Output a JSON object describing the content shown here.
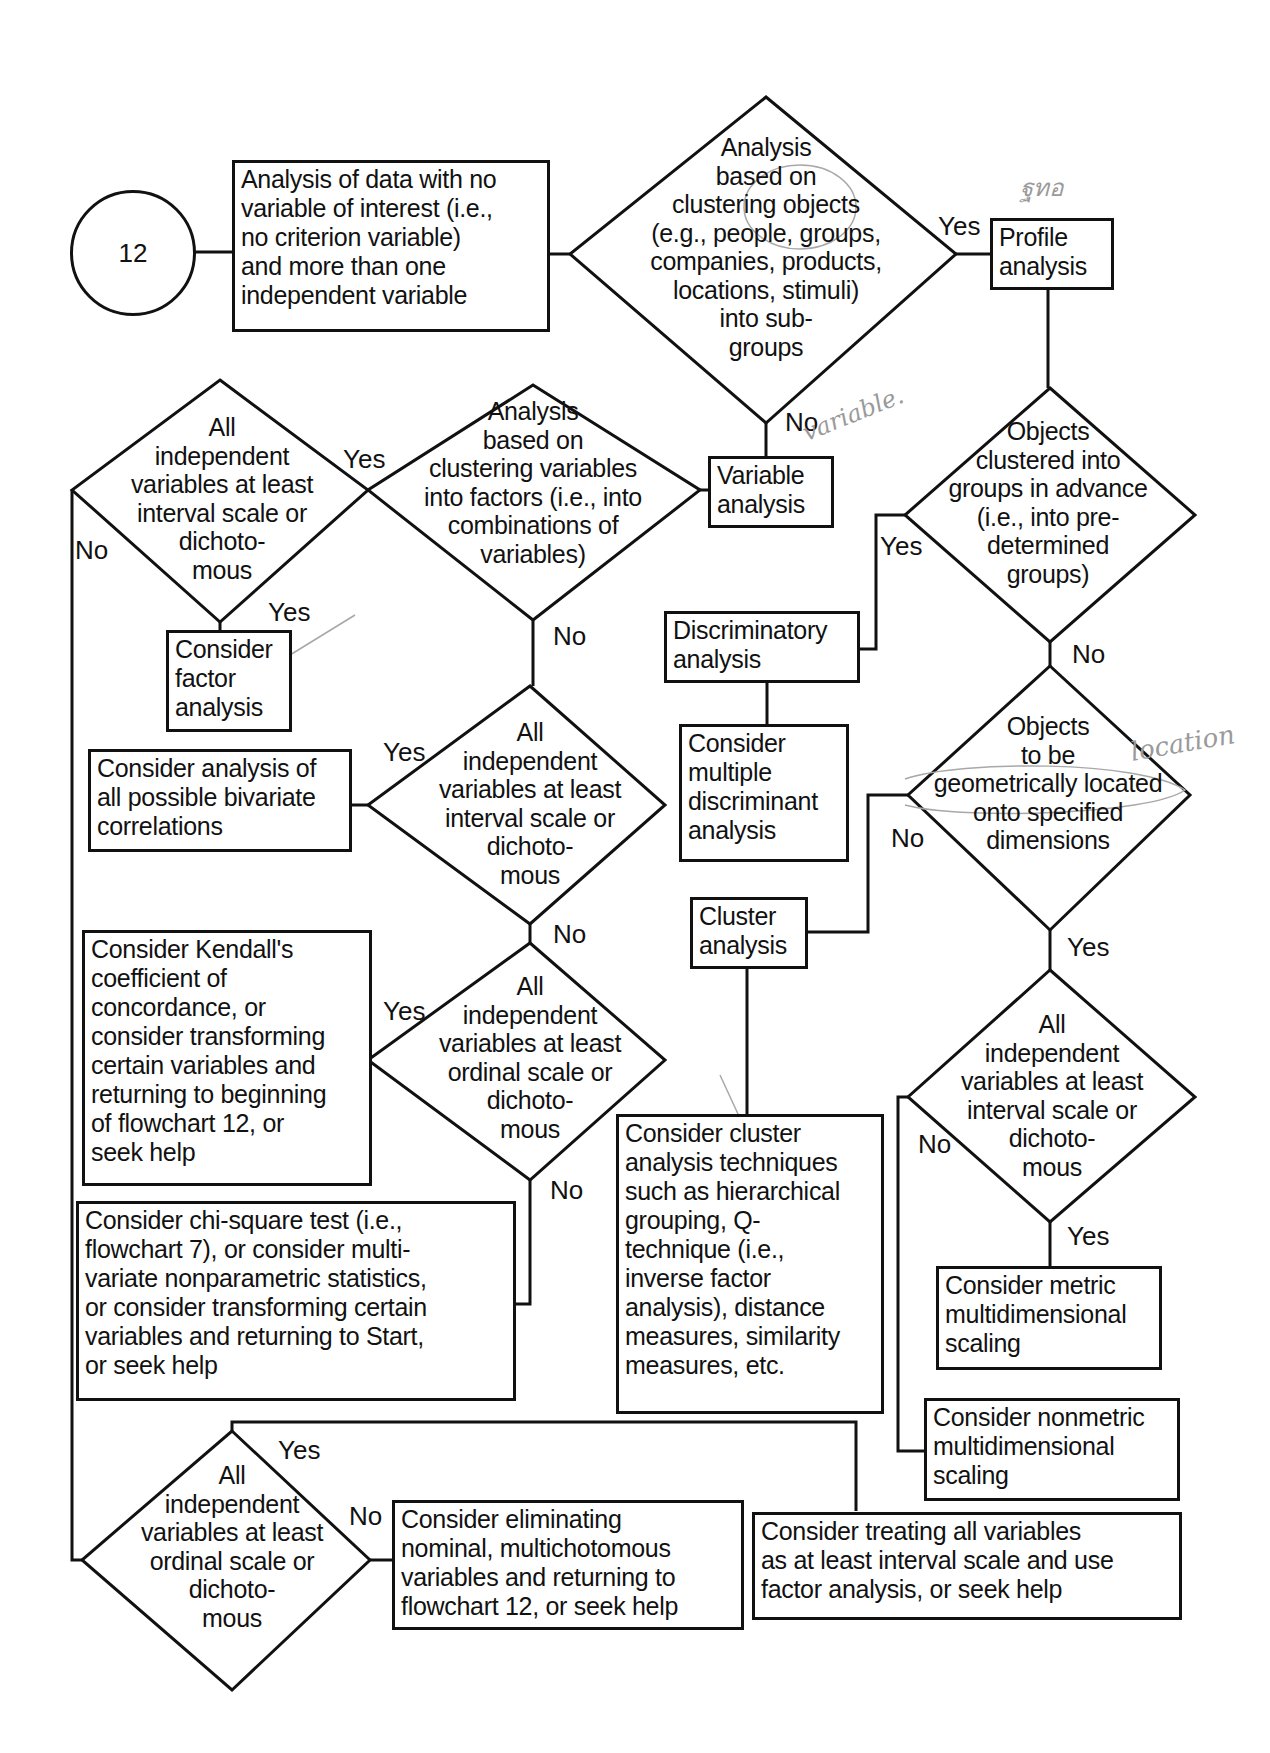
{
  "flowchart": {
    "start_node": "12",
    "nodes": {
      "start_box": "Analysis of data with no\nvariable of interest (i.e.,\nno criterion variable)\nand more than one\nindependent variable",
      "d_cluster_objects": "Analysis\nbased on\nclustering objects\n(e.g., people, groups,\ncompanies, products,\nlocations, stimuli)\ninto sub-\ngroups",
      "profile_analysis": "Profile\nanalysis",
      "variable_analysis": "Variable\nanalysis",
      "d_cluster_variables": "Analysis\nbased on\nclustering  variables\ninto factors (i.e., into\ncombinations of\nvariables)",
      "d_interval_top_left": "All\nindependent\nvariables at least\ninterval scale or\ndichoto-\nmous",
      "factor_analysis": "Consider\nfactor\nanalysis",
      "d_interval_mid": "All\nindependent\nvariables at least\ninterval scale or\ndichoto-\nmous",
      "bivariate": "Consider analysis of\nall possible bivariate\ncorrelations",
      "d_ordinal_mid": "All\nindependent\nvariables at least\nordinal scale or\ndichoto-\nmous",
      "kendall": "Consider Kendall's\ncoefficient of\nconcordance, or\nconsider transforming\ncertain variables and\nreturning to beginning\nof flowchart 12, or\nseek help",
      "chi_square": "Consider chi-square test (i.e.,\nflowchart 7), or consider multi-\nvariate nonparametric statistics,\nor consider transforming certain\nvariables and returning to Start,\nor seek help",
      "d_groups_advance": "Objects\nclustered into\ngroups in advance\n(i.e., into pre-\ndetermined\ngroups)",
      "discriminatory": "Discriminatory\nanalysis",
      "multiple_discriminant": "Consider\nmultiple\ndiscriminant\nanalysis",
      "d_geometric": "Objects\nto be\ngeometrically located\nonto specified\ndimensions",
      "cluster_analysis": "Cluster\nanalysis",
      "cluster_techniques": "Consider cluster\nanalysis techniques\nsuch as hierarchical\ngrouping, Q-\ntechnique (i.e.,\ninverse factor\nanalysis), distance\nmeasures, similarity\nmeasures, etc.",
      "d_interval_right": "All\nindependent\nvariables at least\ninterval scale or\ndichoto-\nmous",
      "metric_mds": "Consider metric\nmultidimensional\nscaling",
      "nonmetric_mds": "Consider nonmetric\nmultidimensional\nscaling",
      "d_ordinal_bottom": "All\nindependent\nvariables at least\nordinal scale or\ndichoto-\nmous",
      "eliminating": "Consider eliminating\nnominal, multichotomous\nvariables and returning to\nflowchart 12, or seek help",
      "treating_interval": "Consider treating all variables\nas at least interval scale and use\nfactor analysis, or seek help"
    },
    "edge_labels": {
      "yes": "Yes",
      "no": "No"
    },
    "handwritten_annotations": {
      "near_profile": "ฐทอ",
      "near_variable": "variable.",
      "near_geometric": "location"
    }
  }
}
